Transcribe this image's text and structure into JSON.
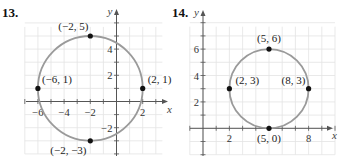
{
  "chart_data": [
    {
      "type": "scatter",
      "title": "13.",
      "xlabel": "x",
      "ylabel": "y",
      "xlim": [
        -7,
        3.5
      ],
      "ylim": [
        -4,
        6
      ],
      "grid": true,
      "x_ticks": [
        -6,
        -4,
        -2,
        2
      ],
      "y_ticks": [
        -2,
        2,
        4
      ],
      "circle": {
        "center": [
          -2,
          1
        ],
        "radius": 4
      },
      "points": [
        {
          "x": -2,
          "y": 5,
          "label": "(−2, 5)"
        },
        {
          "x": -6,
          "y": 1,
          "label": "(−6, 1)"
        },
        {
          "x": 2,
          "y": 1,
          "label": "(2, 1)"
        },
        {
          "x": -2,
          "y": -3,
          "label": "(−2, −3)"
        }
      ]
    },
    {
      "type": "scatter",
      "title": "14.",
      "xlabel": "x",
      "ylabel": "y",
      "xlim": [
        -1,
        10
      ],
      "ylim": [
        -2,
        8
      ],
      "grid": true,
      "x_ticks": [
        2,
        8
      ],
      "y_ticks": [
        2,
        4,
        6
      ],
      "circle": {
        "center": [
          5,
          3
        ],
        "radius": 3
      },
      "points": [
        {
          "x": 5,
          "y": 6,
          "label": "(5, 6)"
        },
        {
          "x": 2,
          "y": 3,
          "label": "(2, 3)"
        },
        {
          "x": 8,
          "y": 3,
          "label": "(8, 3)"
        },
        {
          "x": 5,
          "y": 0,
          "label": "(5, 0)"
        }
      ]
    }
  ],
  "colors": {
    "grid": "#e3e3e3",
    "axis": "#555555",
    "circle": "#9a9a9a",
    "point": "#111111"
  }
}
